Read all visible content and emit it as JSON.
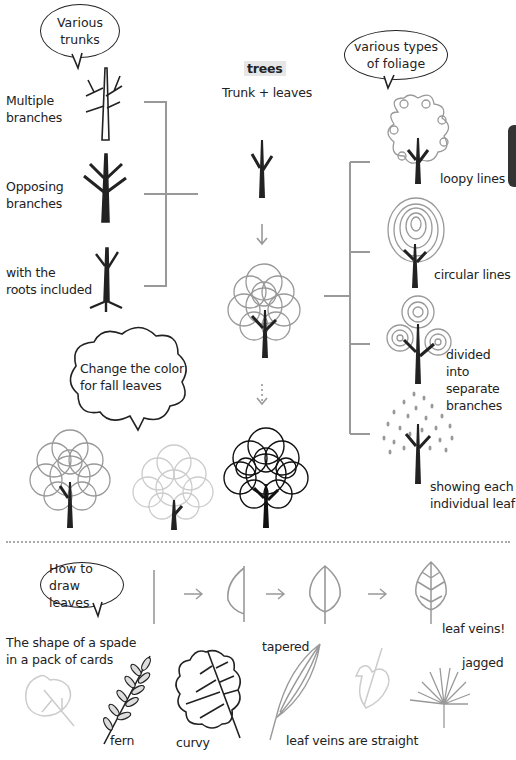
{
  "page": {
    "side_tab_color": "#333333",
    "accent_gray": "#999999"
  },
  "header": {
    "title": "trees",
    "subtitle": "Trunk + leaves"
  },
  "trunks_section": {
    "bubble": "Various\ntrunks",
    "items": [
      {
        "label": "Multiple\nbranches"
      },
      {
        "label": "Opposing\nbranches"
      },
      {
        "label": "with the\nroots included"
      }
    ]
  },
  "foliage_section": {
    "bubble": "various types\nof foliage",
    "items": [
      {
        "label": "loopy lines"
      },
      {
        "label": "circular lines"
      },
      {
        "label": "divided into\nseparate\nbranches"
      },
      {
        "label": "showing each\nindividual leaf"
      }
    ]
  },
  "fall_section": {
    "bubble": "Change the color\nfor fall leaves"
  },
  "leaves_section": {
    "bubble": "How to draw\nleaves",
    "steps_arrow": "→",
    "step_label": "leaf veins!",
    "examples": [
      {
        "label": "The shape of a spade\nin a pack of cards"
      },
      {
        "label": "fern"
      },
      {
        "label": "curvy"
      },
      {
        "label": "tapered"
      },
      {
        "label": "leaf veins are straight"
      },
      {
        "label": "jagged"
      }
    ]
  }
}
